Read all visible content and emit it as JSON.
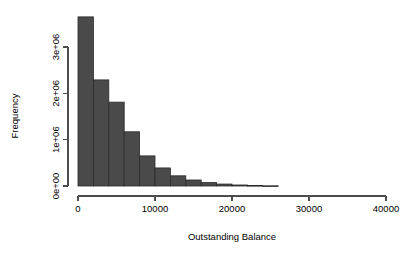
{
  "chart_data": {
    "type": "bar",
    "title": "",
    "subtitle": "",
    "xlabel": "Outstanding Balance",
    "ylabel": "Frequency",
    "grid": false,
    "legend": false,
    "legend_position": "none",
    "xlim": [
      0,
      40000
    ],
    "ylim": [
      0,
      3900000
    ],
    "xticks": [
      0,
      10000,
      20000,
      30000,
      40000
    ],
    "xtick_labels": [
      "0",
      "10000",
      "20000",
      "30000",
      "40000"
    ],
    "yticks": [
      0,
      1000000,
      2000000,
      3000000
    ],
    "ytick_labels": [
      "0e+00",
      "1e+06",
      "2e+06",
      "3e+06"
    ],
    "bin_width": 2000,
    "bin_starts": [
      0,
      2000,
      4000,
      6000,
      8000,
      10000,
      12000,
      14000,
      16000,
      18000,
      20000,
      22000,
      24000
    ],
    "categories": [
      "0-2000",
      "2000-4000",
      "4000-6000",
      "6000-8000",
      "8000-10000",
      "10000-12000",
      "12000-14000",
      "14000-16000",
      "16000-18000",
      "18000-20000",
      "20000-22000",
      "22000-24000",
      "24000-26000"
    ],
    "values": [
      3650000,
      2290000,
      1810000,
      1170000,
      650000,
      390000,
      220000,
      130000,
      75000,
      42000,
      22000,
      10000,
      4000
    ],
    "bar_color": "#4a4a4a",
    "bar_border_color": "#2b2b2b",
    "axis_color": "#4d4d4d"
  },
  "labels": {
    "x_axis_title": "Outstanding Balance",
    "y_axis_title": "Frequency"
  }
}
